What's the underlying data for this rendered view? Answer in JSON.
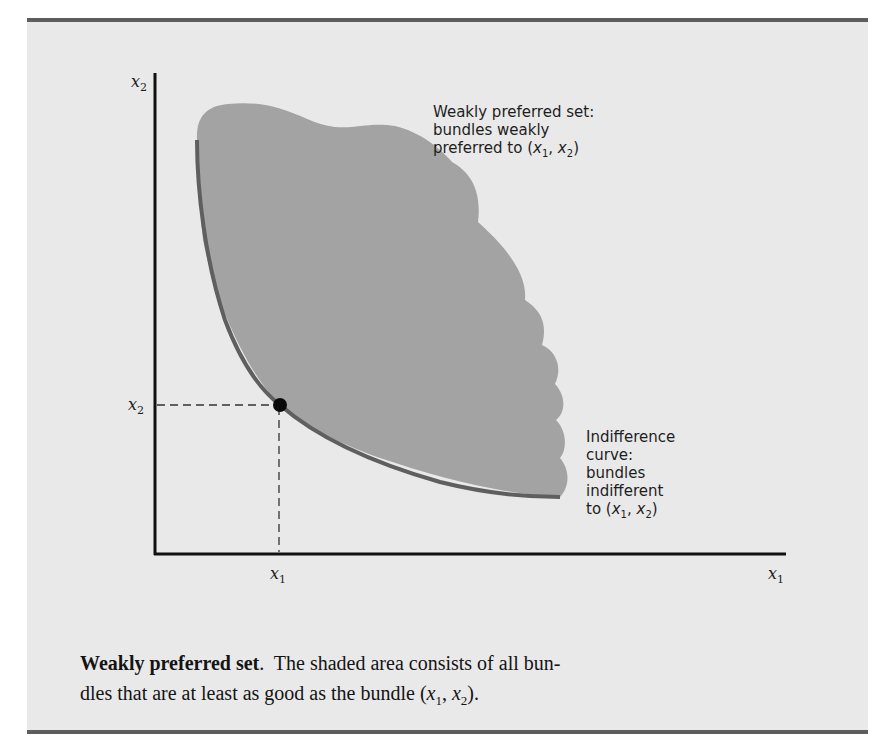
{
  "figure": {
    "y_axis_label": "x",
    "y_axis_sub": "2",
    "x_axis_label": "x",
    "x_axis_sub": "1",
    "point_y_tick_label": "x",
    "point_y_tick_sub": "2",
    "point_x_tick_label": "x",
    "point_x_tick_sub": "1",
    "annotations": {
      "weakly_preferred": {
        "line1": "Weakly preferred set:",
        "line2": "bundles weakly",
        "line3_prefix": "preferred to (",
        "x1": "x",
        "x1_sub": "1",
        "comma": ", ",
        "x2": "x",
        "x2_sub": "2",
        "close": ")"
      },
      "indifference": {
        "line1": "Indifference",
        "line2": "curve:",
        "line3": "bundles",
        "line4": "indifferent",
        "line5_prefix": "to (",
        "x1": "x",
        "x1_sub": "1",
        "comma": ", ",
        "x2": "x",
        "x2_sub": "2",
        "close": ")"
      }
    },
    "colors": {
      "panel_bg": "#e9e9e9",
      "shaded_set": "#a3a3a3",
      "indifference_curve": "#5f5f5f",
      "axes": "#111111",
      "rule": "#5d5d5d"
    }
  },
  "caption": {
    "title": "Weakly preferred set",
    "title_period": ".",
    "text_part1": "  The shaded area consists of all bun-",
    "text_part2": "dles that are at least as good as the bundle (",
    "x1": "x",
    "x1_sub": "1",
    "comma": ", ",
    "x2": "x",
    "x2_sub": "2",
    "close": ")."
  }
}
